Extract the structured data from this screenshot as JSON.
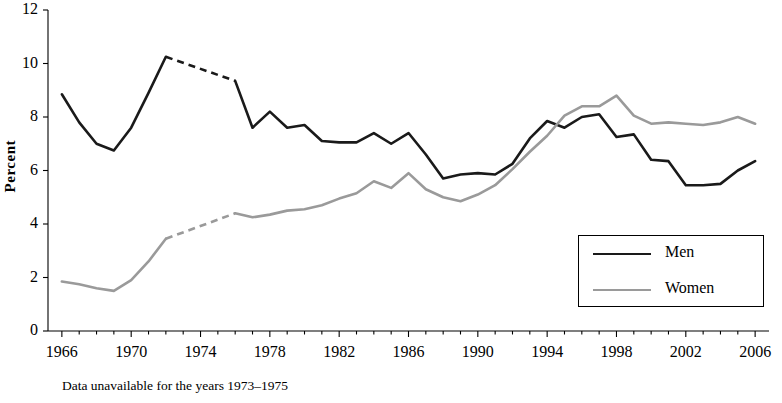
{
  "chart_data": {
    "type": "line",
    "title": "",
    "xlabel": "",
    "ylabel": "Percent",
    "xlim": [
      1965.2,
      2006.8
    ],
    "ylim": [
      0,
      12
    ],
    "yticks": [
      0,
      2,
      4,
      6,
      8,
      10,
      12
    ],
    "xticks": [
      1966,
      1970,
      1974,
      1978,
      1982,
      1986,
      1990,
      1994,
      1998,
      2002,
      2006
    ],
    "grid": false,
    "legend_position": "inside-bottom-right",
    "annotation": "Data unavailable for the years 1973–1975",
    "x": [
      1966,
      1967,
      1968,
      1969,
      1970,
      1971,
      1972,
      1973,
      1974,
      1975,
      1976,
      1977,
      1978,
      1979,
      1980,
      1981,
      1982,
      1983,
      1984,
      1985,
      1986,
      1987,
      1988,
      1989,
      1990,
      1991,
      1992,
      1993,
      1994,
      1995,
      1996,
      1997,
      1998,
      1999,
      2000,
      2001,
      2002,
      2003,
      2004,
      2005,
      2006
    ],
    "series": [
      {
        "name": "Men",
        "color": "#1a1a1a",
        "width": 2.6,
        "gap_years": [
          1973,
          1974,
          1975
        ],
        "values": [
          8.85,
          7.8,
          7.0,
          6.75,
          7.6,
          8.9,
          10.25,
          null,
          null,
          null,
          9.35,
          7.6,
          8.2,
          7.6,
          7.7,
          7.1,
          7.05,
          7.05,
          7.4,
          7.0,
          7.4,
          6.6,
          5.7,
          5.85,
          5.9,
          5.85,
          6.25,
          7.2,
          7.85,
          7.6,
          8.0,
          8.1,
          7.25,
          7.35,
          6.4,
          6.35,
          5.45,
          5.45,
          5.5,
          6.0,
          6.35
        ]
      },
      {
        "name": "Women",
        "color": "#9a9a9a",
        "width": 2.6,
        "gap_years": [
          1973,
          1974,
          1975
        ],
        "values": [
          1.85,
          1.75,
          1.6,
          1.5,
          1.9,
          2.6,
          3.45,
          null,
          null,
          null,
          4.4,
          4.25,
          4.35,
          4.5,
          4.55,
          4.7,
          4.95,
          5.15,
          5.6,
          5.35,
          5.9,
          5.3,
          5.0,
          4.85,
          5.1,
          5.45,
          6.05,
          6.7,
          7.3,
          8.05,
          8.4,
          8.4,
          8.8,
          8.05,
          7.75,
          7.8,
          7.75,
          7.7,
          7.8,
          8.0,
          7.75
        ]
      }
    ]
  },
  "axis": {
    "y_label": "Percent",
    "y_ticks": [
      "0",
      "2",
      "4",
      "6",
      "8",
      "10",
      "12"
    ],
    "x_ticks": [
      "1966",
      "1970",
      "1974",
      "1978",
      "1982",
      "1986",
      "1990",
      "1994",
      "1998",
      "2002",
      "2006"
    ]
  },
  "legend": {
    "items": [
      {
        "label": "Men",
        "color": "#1a1a1a"
      },
      {
        "label": "Women",
        "color": "#9a9a9a"
      }
    ]
  },
  "footnote": "Data unavailable for the years 1973–1975"
}
